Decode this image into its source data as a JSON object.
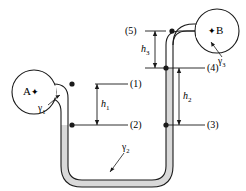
{
  "figure": {
    "type": "manometer-diagram",
    "background_color": "#ffffff",
    "line_color": "#1a1a1a",
    "fluid_fill_color": "#d9d9d9",
    "pipe_fill_color": "#ffffff"
  },
  "tanks": [
    {
      "id": "tank-a",
      "label": "A",
      "marker": "✦",
      "label_order": "label-then-marker",
      "cx": 34,
      "cy": 92,
      "r": 22
    },
    {
      "id": "tank-b",
      "label": "B",
      "marker": "✦",
      "label_order": "marker-then-label",
      "cx": 217,
      "cy": 31,
      "r": 22
    }
  ],
  "points": [
    {
      "id": "point-1",
      "label": "(1)",
      "x": 113,
      "y": 84
    },
    {
      "id": "point-2",
      "label": "(2)",
      "x": 113,
      "y": 125
    },
    {
      "id": "point-3",
      "label": "(3)",
      "x": 190,
      "y": 125
    },
    {
      "id": "point-4",
      "label": "(4)",
      "x": 190,
      "y": 68
    },
    {
      "id": "point-5",
      "label": "(5)",
      "x": 140,
      "y": 31
    }
  ],
  "dimensions": [
    {
      "id": "h1",
      "label": "h",
      "subscript": "1",
      "from_point": "(1)",
      "to_point": "(2)",
      "orientation": "vertical"
    },
    {
      "id": "h2",
      "label": "h",
      "subscript": "2",
      "from_point": "(4)",
      "to_point": "(3)",
      "orientation": "vertical"
    },
    {
      "id": "h3",
      "label": "h",
      "subscript": "3",
      "from_point": "(5)",
      "to_point": "(4)",
      "orientation": "vertical"
    }
  ],
  "fluids": [
    {
      "id": "gamma-1",
      "label": "γ",
      "subscript": "1",
      "x": 40,
      "y": 108,
      "describes": "fluid in pipe from tank A"
    },
    {
      "id": "gamma-2",
      "label": "γ",
      "subscript": "2",
      "x": 125,
      "y": 148,
      "describes": "manometer fluid in lower U-bend"
    },
    {
      "id": "gamma-3",
      "label": "γ",
      "subscript": "3",
      "x": 222,
      "y": 62,
      "describes": "fluid in pipe to tank B"
    }
  ],
  "dots": [
    {
      "id": "dot-elbow-a",
      "x": 72,
      "y": 84
    },
    {
      "id": "dot-point-2",
      "x": 72,
      "y": 125
    },
    {
      "id": "dot-point-3",
      "x": 166,
      "y": 125
    },
    {
      "id": "dot-point-4",
      "x": 166,
      "y": 68
    },
    {
      "id": "dot-point-5",
      "x": 172,
      "y": 31
    }
  ]
}
